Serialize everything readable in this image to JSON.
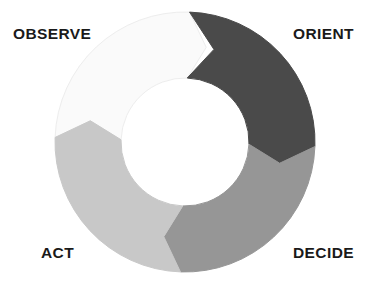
{
  "diagram": {
    "name": "OODA Loop",
    "type": "cyclical-process-donut",
    "background_color": "#ffffff",
    "geometry": {
      "center_x": 185,
      "center_y": 142,
      "outer_radius": 130,
      "inner_radius": 64,
      "notch_depth": 26,
      "chevron_depth": 18,
      "start_angle_deg": -88,
      "direction": "clockwise"
    },
    "segments": [
      {
        "id": "orient",
        "label": "ORIENT",
        "color": "#4a4a4a",
        "stroke": "#4a4a4a",
        "start_angle_deg": -88,
        "end_angle_deg": 2,
        "sweep_deg": 90,
        "order": 2,
        "label_position": "top-right"
      },
      {
        "id": "decide",
        "label": "DECIDE",
        "color": "#969696",
        "stroke": "#969696",
        "start_angle_deg": 2,
        "end_angle_deg": 92,
        "sweep_deg": 90,
        "order": 3,
        "label_position": "bottom-right"
      },
      {
        "id": "act",
        "label": "ACT",
        "color": "#c8c8c8",
        "stroke": "#c8c8c8",
        "start_angle_deg": 92,
        "end_angle_deg": 182,
        "sweep_deg": 90,
        "order": 4,
        "label_position": "bottom-left"
      },
      {
        "id": "observe",
        "label": "OBSERVE",
        "color": "#fafafa",
        "stroke": "#ededed",
        "start_angle_deg": 182,
        "end_angle_deg": 272,
        "sweep_deg": 90,
        "order": 1,
        "label_position": "top-left"
      }
    ],
    "labels": {
      "observe": "OBSERVE",
      "orient": "ORIENT",
      "act": "ACT",
      "decide": "DECIDE"
    }
  }
}
